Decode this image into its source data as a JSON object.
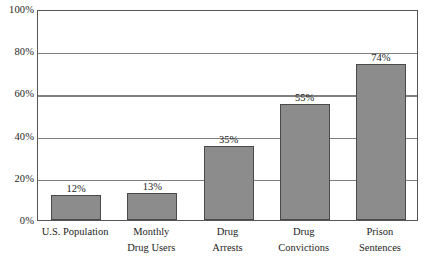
{
  "chart_data": {
    "type": "bar",
    "title": "",
    "xlabel": "",
    "ylabel": "",
    "ylim": [
      0,
      100
    ],
    "yticks": [
      "0%",
      "20%",
      "40%",
      "60%",
      "80%",
      "100%"
    ],
    "ytick_values": [
      0,
      20,
      40,
      60,
      80,
      100
    ],
    "grid": true,
    "legend": "none",
    "categories": [
      "U.S. Population",
      "Monthly Drug Users",
      "Drug Arrests",
      "Drug Convictions",
      "Prison Sentences"
    ],
    "category_lines": [
      [
        "U.S. Population"
      ],
      [
        "Monthly",
        "Drug Users"
      ],
      [
        "Drug",
        "Arrests"
      ],
      [
        "Drug",
        "Convictions"
      ],
      [
        "Prison",
        "Sentences"
      ]
    ],
    "values": [
      12,
      13,
      35,
      55,
      74
    ],
    "value_labels": [
      "12%",
      "13%",
      "35%",
      "55%",
      "74%"
    ],
    "colors": {
      "bar_fill": "#8c8c8c",
      "bar_edge": "#4a4a4a",
      "gridline": "#808080",
      "frame": "#555555",
      "text": "#1d1d1d",
      "background": "#ffffff"
    }
  }
}
